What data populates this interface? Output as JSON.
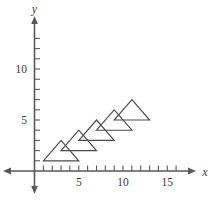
{
  "figure": {
    "background_color": "#ffffff",
    "axis_color": "#58585a",
    "shape_color": "#4a4a4c"
  },
  "axes": {
    "x_axis_label": "x",
    "y_axis_label": "y",
    "x_tick_labels": [
      "5",
      "10",
      "15"
    ],
    "y_tick_labels": [
      "5",
      "10"
    ]
  },
  "chart_data": {
    "type": "scatter",
    "title": "",
    "xlabel": "x",
    "ylabel": "y",
    "xlim": [
      -1,
      17
    ],
    "ylim": [
      -1,
      14
    ],
    "grid": false,
    "legend": "none",
    "x_ticks": [
      1,
      2,
      3,
      4,
      5,
      6,
      7,
      8,
      9,
      10,
      11,
      12,
      13,
      14,
      15,
      16
    ],
    "y_ticks": [
      1,
      2,
      3,
      4,
      5,
      6,
      7,
      8,
      9,
      10,
      11,
      12,
      13
    ],
    "x_tick_labels": {
      "5": "5",
      "10": "10",
      "15": "15"
    },
    "y_tick_labels": {
      "5": "5",
      "10": "10"
    },
    "shapes": [
      {
        "name": "triangle-1",
        "type": "polygon",
        "vertices": [
          [
            1,
            1
          ],
          [
            5,
            1
          ],
          [
            3,
            3
          ]
        ]
      },
      {
        "name": "triangle-2",
        "type": "polygon",
        "vertices": [
          [
            3,
            2
          ],
          [
            7,
            2
          ],
          [
            5,
            4
          ]
        ]
      },
      {
        "name": "triangle-3",
        "type": "polygon",
        "vertices": [
          [
            5,
            3
          ],
          [
            9,
            3
          ],
          [
            7,
            5
          ]
        ]
      },
      {
        "name": "triangle-4",
        "type": "polygon",
        "vertices": [
          [
            7,
            4
          ],
          [
            11,
            4
          ],
          [
            9,
            6
          ]
        ]
      },
      {
        "name": "triangle-5",
        "type": "polygon",
        "vertices": [
          [
            9,
            5
          ],
          [
            13,
            5
          ],
          [
            11,
            7
          ]
        ]
      }
    ],
    "translation_vector": [
      2,
      1
    ],
    "shape_count": 5
  }
}
